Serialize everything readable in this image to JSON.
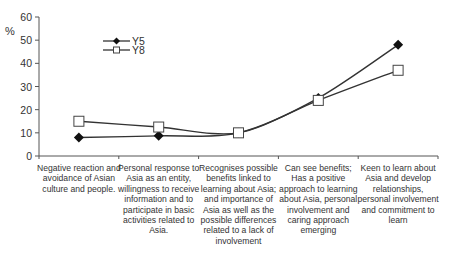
{
  "chart_data": {
    "type": "line",
    "title": "",
    "xlabel": "",
    "ylabel": "%",
    "ylim": [
      0,
      60
    ],
    "yticks": [
      0,
      10,
      20,
      30,
      40,
      50,
      60
    ],
    "grid": false,
    "legend_position": "upper-left-inside",
    "categories": [
      "Negative reaction and avoidance of Asian culture and people.",
      "Personal response to Asia as an entity, willingness to receive information and to participate in basic activities related to Asia.",
      "Recognises possible benefits linked to learning about Asia; and importance of Asia as well as the possible differences related to a lack of involvement",
      "Can see benefits; Has a positive approach to learning about Asia, personal involvement and caring approach emerging",
      "Keen to learn about Asia and develop relationships, personal involvement and commitment to learn"
    ],
    "series": [
      {
        "name": "Y5",
        "marker": "filled-diamond",
        "values": [
          8,
          8.7,
          10,
          25,
          48
        ]
      },
      {
        "name": "Y8",
        "marker": "open-square",
        "values": [
          15,
          12.5,
          10,
          24,
          37
        ]
      }
    ]
  },
  "axis": {
    "y_unit_label": "%"
  },
  "xlabels": [
    "Negative reaction and avoidance of Asian culture and people.",
    "Personal response to Asia as an entity, willingness to receive information and to participate in basic activities related to Asia.",
    "Recognises possible benefits linked to learning about Asia; and importance of Asia as well as the possible differences related to a lack of involvement",
    "Can see benefits; Has a positive approach to learning about Asia, personal involvement and caring approach emerging",
    "Keen to learn about Asia and develop relationships, personal involvement and commitment to learn"
  ],
  "legend": [
    {
      "label": "Y5"
    },
    {
      "label": "Y8"
    }
  ],
  "colors": {
    "line": "#333333",
    "axis": "#555555"
  }
}
